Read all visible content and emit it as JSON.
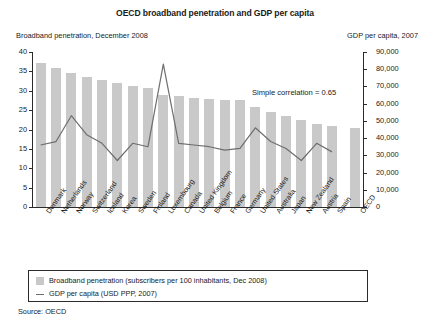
{
  "chart_data": {
    "type": "bar",
    "title": "OECD broadband penetration and GDP per capita",
    "left_axis_caption": "Broadband penetration, December 2008",
    "right_axis_caption": "GDP per capita, 2007",
    "annotation": "Simple correlation = 0.65",
    "source": "Source: OECD",
    "xlabel": "",
    "ylabel": "Broadband penetration",
    "y2label": "GDP per capita",
    "ylim": [
      0,
      40
    ],
    "y2lim": [
      0,
      90000
    ],
    "yticks": [
      0,
      5,
      10,
      15,
      20,
      25,
      30,
      35,
      40
    ],
    "ytick_labels": [
      "0",
      "5",
      "10",
      "15",
      "20",
      "25",
      "30",
      "35",
      "40"
    ],
    "y2ticks": [
      0,
      10000,
      20000,
      30000,
      40000,
      50000,
      60000,
      70000,
      80000,
      90000
    ],
    "y2tick_labels": [
      "0",
      "10,000",
      "20,000",
      "30,000",
      "40,000",
      "50,000",
      "60,000",
      "70,000",
      "80,000",
      "90,000"
    ],
    "grid": false,
    "legend_position": "below-plot",
    "categories": [
      "Denmark",
      "Netherlands",
      "Norway",
      "Switzerland",
      "Iceland",
      "Korea",
      "Sweden",
      "Finland",
      "Luxembourg",
      "Canada",
      "United Kingdom",
      "Belgium",
      "France",
      "Germany",
      "United States",
      "Australia",
      "Japan",
      "New Zealand",
      "Austria",
      "Spain",
      "OECD"
    ],
    "series": [
      {
        "name": "Broadband penetration (subscribers per 100 inhabitants, Dec 2008)",
        "type": "bar",
        "axis": "left",
        "color": "#c9c9c9",
        "values": [
          37.2,
          35.8,
          34.5,
          33.6,
          32.8,
          32.1,
          31.3,
          30.6,
          29.0,
          28.6,
          28.2,
          27.9,
          27.7,
          27.5,
          25.8,
          24.6,
          23.6,
          22.4,
          21.4,
          20.8,
          20.3
        ]
      },
      {
        "name": "GDP per capita (USD PPP, 2007)",
        "type": "line",
        "axis": "right",
        "color": "#6e6e6e",
        "values": [
          36000,
          38000,
          53000,
          42000,
          37000,
          27000,
          37000,
          35000,
          83000,
          37000,
          36000,
          35000,
          33000,
          34000,
          46000,
          38000,
          34000,
          27000,
          37000,
          32000,
          null
        ]
      }
    ],
    "legend": [
      {
        "swatch": "bar",
        "label": "Broadband penetration (subscribers per 100 inhabitants, Dec 2008)"
      },
      {
        "swatch": "line",
        "label": "GDP per capita (USD PPP, 2007)"
      }
    ]
  }
}
